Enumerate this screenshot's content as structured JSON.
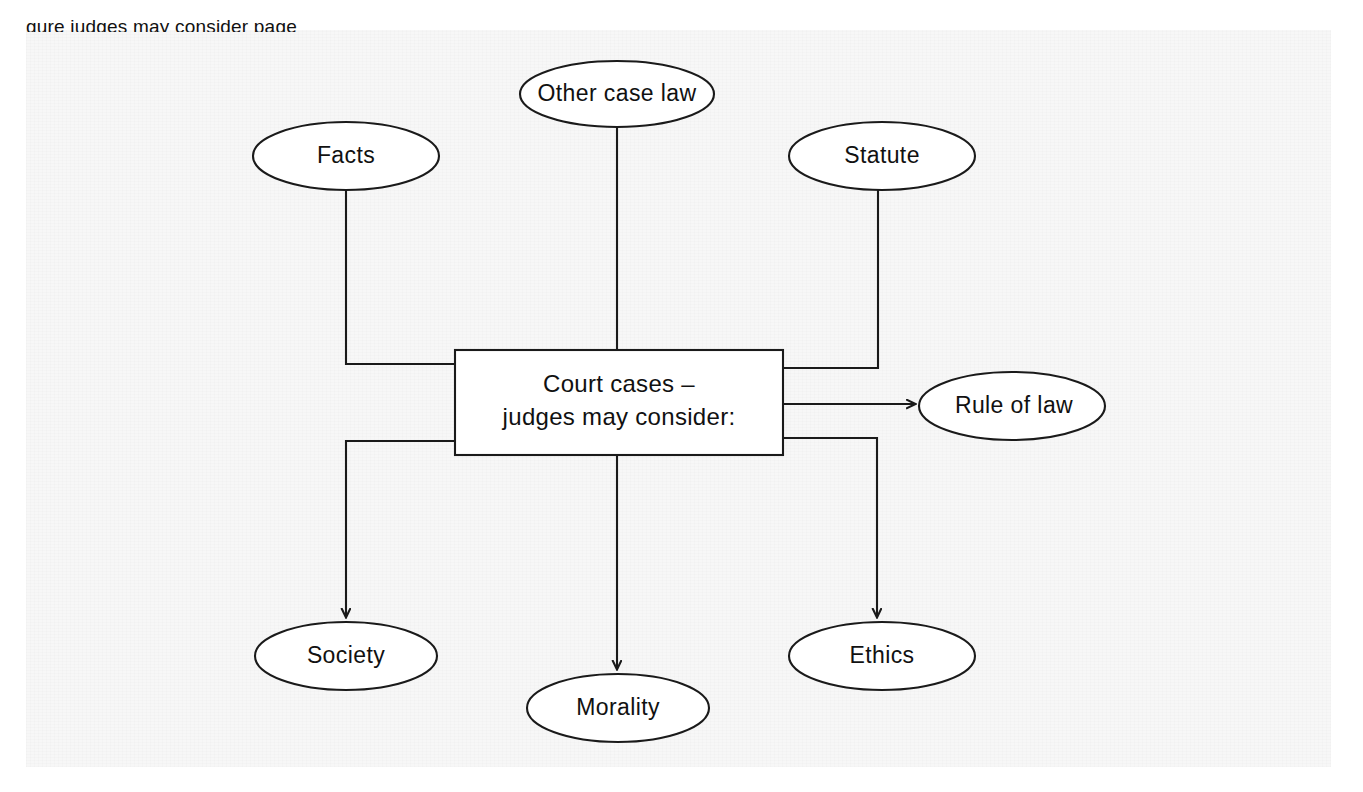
{
  "figure": {
    "type": "concept-map",
    "clipped_caption_fragment": "gure       judges may consider       page",
    "background_color": "#f7f7f7",
    "line_color": "#1a1a1a",
    "node_fill": "#ffffff"
  },
  "center_node": {
    "name": "court-cases-box",
    "shape": "rectangle",
    "line1": "Court cases –",
    "line2": "judges may consider:",
    "x": 455,
    "y": 350,
    "width": 328,
    "height": 105
  },
  "nodes": [
    {
      "id": "other-case-law",
      "label": "Other case law",
      "shape": "ellipse",
      "cx": 617,
      "cy": 94,
      "rx": 97,
      "ry": 33
    },
    {
      "id": "facts",
      "label": "Facts",
      "shape": "ellipse",
      "cx": 346,
      "cy": 156,
      "rx": 93,
      "ry": 34
    },
    {
      "id": "statute",
      "label": "Statute",
      "shape": "ellipse",
      "cx": 882,
      "cy": 156,
      "rx": 93,
      "ry": 34
    },
    {
      "id": "rule-of-law",
      "label": "Rule of law",
      "shape": "ellipse",
      "cx": 1012,
      "cy": 406,
      "rx": 93,
      "ry": 34
    },
    {
      "id": "society",
      "label": "Society",
      "shape": "ellipse",
      "cx": 346,
      "cy": 656,
      "rx": 91,
      "ry": 34
    },
    {
      "id": "morality",
      "label": "Morality",
      "shape": "ellipse",
      "cx": 618,
      "cy": 708,
      "rx": 91,
      "ry": 34
    },
    {
      "id": "ethics",
      "label": "Ethics",
      "shape": "ellipse",
      "cx": 882,
      "cy": 656,
      "rx": 93,
      "ry": 34
    }
  ],
  "connectors": [
    {
      "id": "facts-to-box",
      "from": "facts",
      "to": "court-cases-box",
      "arrow": false,
      "path": "M 346 190 L 346 364 L 455 364"
    },
    {
      "id": "other-case-law-to-box",
      "from": "other-case-law",
      "to": "court-cases-box",
      "arrow": false,
      "path": "M 617 127 L 617 350"
    },
    {
      "id": "statute-to-box",
      "from": "statute",
      "to": "court-cases-box",
      "arrow": false,
      "path": "M 878 190 L 878 368 L 783 368"
    },
    {
      "id": "box-to-rule-of-law",
      "from": "court-cases-box",
      "to": "rule-of-law",
      "arrow": true,
      "path": "M 783 404 L 915 404"
    },
    {
      "id": "box-to-society",
      "from": "court-cases-box",
      "to": "society",
      "arrow": true,
      "path": "M 455 441 L 346 441 L 346 617"
    },
    {
      "id": "box-to-morality",
      "from": "court-cases-box",
      "to": "morality",
      "arrow": true,
      "path": "M 617 455 L 617 669"
    },
    {
      "id": "box-to-ethics",
      "from": "court-cases-box",
      "to": "ethics",
      "arrow": true,
      "path": "M 783 438 L 877 438 L 877 617"
    }
  ]
}
